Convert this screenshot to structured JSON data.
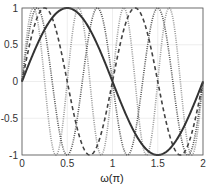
{
  "chart_data": {
    "type": "line",
    "title": "",
    "xlabel": "ω(π)",
    "ylabel": "",
    "xlim": [
      0,
      2
    ],
    "ylim": [
      -1,
      1
    ],
    "xticks": [
      0,
      0.5,
      1,
      1.5,
      2
    ],
    "xtick_labels": [
      "0",
      "0.5",
      "1",
      "1.5",
      "2"
    ],
    "yticks": [
      -1,
      -0.5,
      0,
      0.5,
      1
    ],
    "ytick_labels": [
      "-1",
      "-0.5",
      "0",
      "0.5",
      "1"
    ],
    "grid": true,
    "legend": null,
    "series": [
      {
        "name": "sin(πω)",
        "frequency": 1,
        "style": "solid",
        "color": "#333333",
        "width": 2
      },
      {
        "name": "sin(2πω)",
        "frequency": 2,
        "style": "dashed",
        "color": "#444444",
        "width": 1.6
      },
      {
        "name": "sin(3πω)",
        "frequency": 3,
        "style": "dotted",
        "color": "#555555",
        "width": 1.6
      },
      {
        "name": "sin(4πω)",
        "frequency": 4,
        "style": "dotted",
        "color": "#9a9a9a",
        "width": 1.6
      }
    ]
  },
  "axes": {
    "xlabel": "ω(π)"
  }
}
